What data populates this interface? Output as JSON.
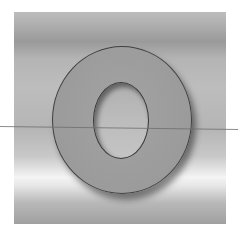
{
  "image": {
    "subject": "letter O",
    "letter": "O",
    "panel_color": "#b5b5b5",
    "letter_color": "#9c9c9c",
    "outline_color": "#404040",
    "line_color": "#6e6e6e"
  }
}
